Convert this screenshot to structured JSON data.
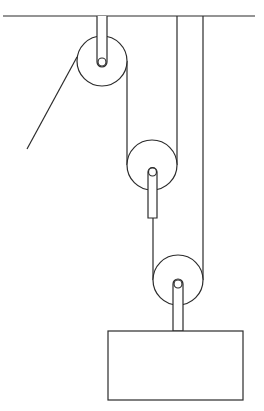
{
  "diagram": {
    "type": "pulley-system",
    "stroke_color": "#2b2b2b",
    "background": "#ffffff",
    "ceiling": {
      "x1": 3,
      "x2": 255,
      "y": 16
    },
    "pulleys": [
      {
        "id": "fixed-top",
        "cx": 102,
        "cy": 61,
        "r": 25,
        "axle_r": 4,
        "bracket": {
          "x": 97,
          "y": 16,
          "w": 10,
          "h": 46
        }
      },
      {
        "id": "movable-middle",
        "cx": 152,
        "cy": 165,
        "r": 25,
        "axle_r": 4,
        "bracket": {
          "x": 148,
          "y": 168,
          "w": 9,
          "h": 50
        }
      },
      {
        "id": "movable-bottom",
        "cx": 178,
        "cy": 280,
        "r": 25,
        "axle_r": 4,
        "bracket": {
          "x": 173,
          "y": 280,
          "w": 10,
          "h": 51
        }
      }
    ],
    "ropes": [
      {
        "id": "pull-rope",
        "x1": 77,
        "y1": 57,
        "x2": 27,
        "y2": 149
      },
      {
        "id": "top-to-middle",
        "x1": 127,
        "y1": 61,
        "x2": 127,
        "y2": 165
      },
      {
        "id": "middle-right-to-ceiling",
        "x1": 177,
        "y1": 16,
        "x2": 177,
        "y2": 165
      },
      {
        "id": "middle-bracket-to-bottom-left",
        "x1": 153,
        "y1": 218,
        "x2": 153,
        "y2": 280
      },
      {
        "id": "bottom-right-to-ceiling",
        "x1": 203,
        "y1": 16,
        "x2": 203,
        "y2": 280
      }
    ],
    "load": {
      "x": 108,
      "y": 331,
      "w": 135,
      "h": 69
    }
  }
}
